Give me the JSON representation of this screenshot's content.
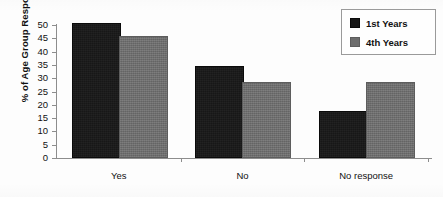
{
  "chart_data": {
    "type": "bar",
    "title": "",
    "xlabel": "",
    "ylabel": "% of Age Group Responding",
    "categories": [
      "Yes",
      "No",
      "No response"
    ],
    "series": [
      {
        "name": "1st Years",
        "color": "#171717",
        "values": [
          50,
          34,
          17
        ]
      },
      {
        "name": "4th Years",
        "color": "#6d6d6d",
        "values": [
          45,
          28,
          28
        ]
      }
    ],
    "ylim": [
      0,
      50
    ],
    "ytick_values": [
      50,
      45,
      40,
      35,
      30,
      25,
      20,
      15,
      10,
      5,
      0
    ],
    "ytick_labels": [
      "50",
      "45",
      "40",
      "35",
      "30",
      "25",
      "20",
      "15",
      "10",
      "5",
      "0"
    ],
    "grid": false,
    "legend_position": "top-right",
    "axis_color": "#8d8d8d"
  },
  "legend": {
    "entries": [
      {
        "label": "1st Years",
        "swatch": "legend-swatch-1st-years"
      },
      {
        "label": "4th Years",
        "swatch": "legend-swatch-4th-years"
      }
    ]
  }
}
